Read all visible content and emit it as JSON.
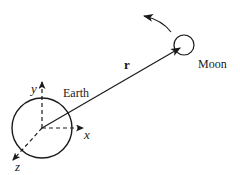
{
  "diagram": {
    "earth": {
      "label": "Earth",
      "center": [
        42,
        128
      ],
      "radius": 30
    },
    "moon": {
      "label": "Moon",
      "center": [
        184,
        45
      ],
      "radius": 10
    },
    "axes": {
      "x": {
        "label": "x"
      },
      "y": {
        "label": "y"
      },
      "z": {
        "label": "z"
      }
    },
    "position_vector": {
      "label": "r"
    },
    "orbit_direction_arrow": "counterclockwise",
    "colors": {
      "stroke": "#1a1a1a",
      "background": "#ffffff"
    }
  }
}
